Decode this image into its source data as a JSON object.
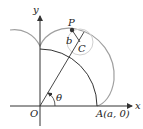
{
  "diagram": {
    "type": "geometry-epicycloid",
    "labels": {
      "x_axis": "x",
      "y_axis": "y",
      "origin": "O",
      "point_p": "P",
      "radius_b": "b",
      "center_c": "C",
      "angle": "θ",
      "point_a": "A(a, 0)"
    },
    "colors": {
      "axes": "#333333",
      "fixed_circle": "#333333",
      "rolling_circle": "#c8c8c8",
      "curve": "#a0a0a0",
      "point": "#333333"
    }
  }
}
